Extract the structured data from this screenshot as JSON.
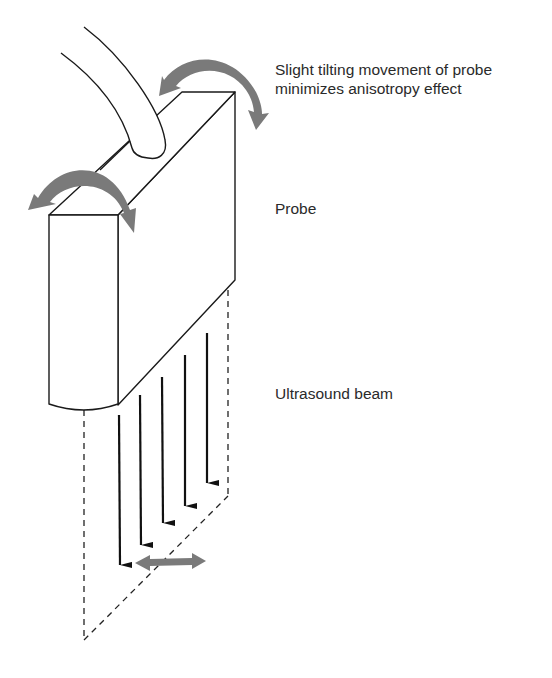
{
  "figure": {
    "labels": {
      "tilt_line1": "Slight tilting movement of probe",
      "tilt_line2": "minimizes anisotropy effect",
      "probe": "Probe",
      "beam": "Ultrasound beam"
    },
    "elements": {
      "probe_body": "rectangular-probe-block",
      "cable": "probe-cable",
      "tilt_arrows": [
        "curved-tilt-arrow-back",
        "curved-tilt-arrow-front"
      ],
      "beam_arrows_count": 5,
      "scan_plane": "dashed-scan-plane",
      "lateral_arrow": "double-headed-horizontal-arrow"
    },
    "colors": {
      "line": "#1a1a1a",
      "arrow_gray": "#7a7a7a",
      "text": "#2a2a2a",
      "background": "#ffffff"
    }
  }
}
